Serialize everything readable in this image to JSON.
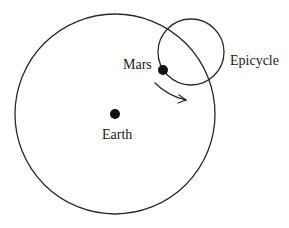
{
  "diagram": {
    "type": "ptolemaic-epicycle-model",
    "background_color": "#ffffff",
    "stroke_color": "#2a2a2a",
    "labels": {
      "earth": "Earth",
      "mars": "Mars",
      "epicycle": "Epicycle"
    },
    "deferent": {
      "cx": 115,
      "cy": 114,
      "r": 100
    },
    "epicycle_circle": {
      "cx": 191,
      "cy": 52,
      "r": 33
    },
    "earth_dot": {
      "cx": 115,
      "cy": 114,
      "r": 5
    },
    "mars_dot": {
      "cx": 163,
      "cy": 70,
      "r": 5
    },
    "motion_arrow": {
      "direction": "clockwise",
      "start": [
        155,
        83
      ],
      "end": [
        186,
        100
      ]
    }
  }
}
